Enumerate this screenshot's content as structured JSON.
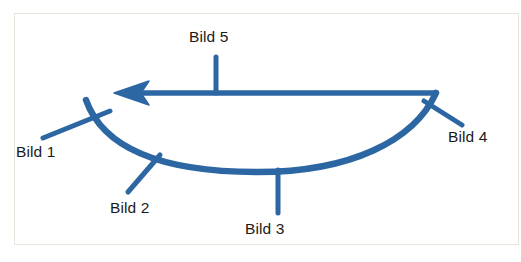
{
  "figure": {
    "kind": "annotated-sketch",
    "border_color": "#e8e5dc",
    "background_color": "#ffffff",
    "stroke_color": "#2d67a3",
    "text_color": "#1a1a1a"
  },
  "labels": {
    "bild1": "Bild 1",
    "bild2": "Bild 2",
    "bild3": "Bild 3",
    "bild4": "Bild 4",
    "bild5": "Bild 5"
  },
  "shapes": {
    "arc_name": "downward-open-arc",
    "arrow_name": "leftward-arrow",
    "arrow_direction": "left"
  }
}
